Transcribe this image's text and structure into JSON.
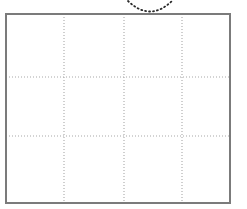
{
  "figure": {
    "title": "",
    "kind": "grid-diagram-with-dotted-arc",
    "canvas": {
      "width": 247,
      "height": 209,
      "background": "#ffffff"
    },
    "frame": {
      "name": "outer-rectangle",
      "x": 6,
      "y": 14,
      "width": 224,
      "height": 189,
      "stroke_color": "#7b7b7b",
      "stroke_width": 1.6,
      "fill_color": "#ffffff"
    },
    "grid": {
      "style": "dotted",
      "stroke_color": "#a8a8a8",
      "stroke_width": 1.1,
      "dash": "1 2",
      "columns": 4,
      "rows": 3,
      "vertical_lines_x": [
        64,
        124,
        182
      ],
      "horizontal_lines_y": [
        77,
        136
      ]
    },
    "arc": {
      "name": "dotted-arc",
      "style": "dotted",
      "stroke_color": "#2b2b2b",
      "stroke_width": 1.8,
      "dash": "1 3",
      "orientation": "concave-up",
      "start": {
        "x": 128,
        "y": 1
      },
      "control": {
        "x": 150,
        "y": 22
      },
      "end": {
        "x": 172,
        "y": 1
      }
    }
  }
}
